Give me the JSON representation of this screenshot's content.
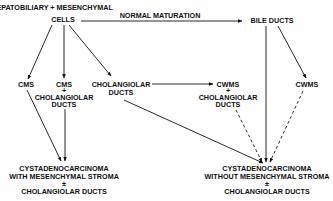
{
  "title": "",
  "nodes": {
    "origin_line1": "HEPATOBILIARY + MESENCHYMAL",
    "origin_line2": "CELLS",
    "normal_maturation": "NORMAL MATURATION",
    "bile_ducts": "BILE DUCTS",
    "cms_left": "CMS",
    "cms_ductal_line1": "CMS",
    "cms_ductal_line2": "+",
    "cms_ductal_line3": "CHOLANGIOLAR",
    "cms_ductal_line4": "DUCTS",
    "cholangiolar_line1": "CHOLANGIOLAR",
    "cholangiolar_line2": "DUCTS",
    "cwms_ductal_line1": "CWMS",
    "cwms_ductal_line2": "+",
    "cwms_ductal_line3": "CHOLANGIOLAR",
    "cwms_ductal_line4": "DUCTS",
    "cwms_right": "CWMS",
    "outcome_with_line1": "CYSTADENOCARCINOMA",
    "outcome_with_line2": "WITH MESENCHYMAL STROMA",
    "outcome_with_line3": "±",
    "outcome_with_line4": "CHOLANGIOLAR DUCTS",
    "outcome_without_line1": "CYSTADENOCARCINOMA",
    "outcome_without_line2": "WITHOUT MESENCHYMAL STROMA",
    "outcome_without_line3": "±",
    "outcome_without_line4": "CHOLANGIOLAR DUCTS"
  },
  "edges": [
    {
      "from": "HEPATOBILIARY + MESENCHYMAL CELLS",
      "to": "BILE DUCTS",
      "label": "NORMAL MATURATION",
      "style": "solid"
    },
    {
      "from": "HEPATOBILIARY + MESENCHYMAL CELLS",
      "to": "CMS",
      "style": "solid"
    },
    {
      "from": "HEPATOBILIARY + MESENCHYMAL CELLS",
      "to": "CMS + CHOLANGIOLAR DUCTS",
      "style": "solid"
    },
    {
      "from": "HEPATOBILIARY + MESENCHYMAL CELLS",
      "to": "CHOLANGIOLAR DUCTS",
      "style": "solid"
    },
    {
      "from": "CHOLANGIOLAR DUCTS",
      "to": "CWMS + CHOLANGIOLAR DUCTS",
      "style": "solid"
    },
    {
      "from": "BILE DUCTS",
      "to": "CWMS",
      "style": "solid"
    },
    {
      "from": "CMS",
      "to": "CYSTADENOCARCINOMA WITH MESENCHYMAL STROMA",
      "style": "solid"
    },
    {
      "from": "CMS + CHOLANGIOLAR DUCTS",
      "to": "CYSTADENOCARCINOMA WITH MESENCHYMAL STROMA",
      "style": "solid"
    },
    {
      "from": "CHOLANGIOLAR DUCTS",
      "to": "CYSTADENOCARCINOMA WITHOUT MESENCHYMAL STROMA",
      "style": "solid"
    },
    {
      "from": "BILE DUCTS",
      "to": "CYSTADENOCARCINOMA WITHOUT MESENCHYMAL STROMA",
      "style": "solid"
    },
    {
      "from": "CWMS + CHOLANGIOLAR DUCTS",
      "to": "CYSTADENOCARCINOMA WITHOUT MESENCHYMAL STROMA",
      "style": "dashed"
    },
    {
      "from": "CWMS",
      "to": "CYSTADENOCARCINOMA WITHOUT MESENCHYMAL STROMA",
      "style": "dashed"
    }
  ]
}
